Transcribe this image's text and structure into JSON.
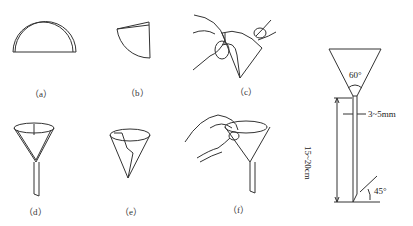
{
  "figure": {
    "panels": [
      {
        "id": "a",
        "label": "（a）",
        "description": "filter paper folded in half (semicircle)"
      },
      {
        "id": "b",
        "label": "（b）",
        "description": "folded again into quarter"
      },
      {
        "id": "c",
        "label": "（c）",
        "description": "opened into cone by hands"
      },
      {
        "id": "d",
        "label": "（d）",
        "description": "filter paper placed in funnel"
      },
      {
        "id": "e",
        "label": "（e）",
        "description": "fluted/torn corner cone"
      },
      {
        "id": "f",
        "label": "（f）",
        "description": "wetting paper with wash bottle in funnel"
      }
    ],
    "funnel_schematic": {
      "angle_top": "60°",
      "stem_diameter": "3~5mm",
      "stem_length": "15~20cm",
      "tip_angle": "45°"
    }
  }
}
